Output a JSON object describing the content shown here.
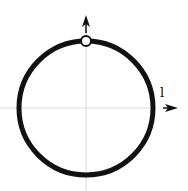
{
  "diagram": {
    "type": "circle-with-axes",
    "label_right": "l",
    "colors": {
      "circle": "#111111",
      "axes": "#d8d8d8",
      "arrow": "#111111",
      "point_fill": "#ffffff"
    },
    "elements": [
      {
        "name": "circle",
        "description": "thick black circle centered at axes origin"
      },
      {
        "name": "open-point",
        "description": "hollow point at top of circle"
      },
      {
        "name": "up-arrow",
        "description": "arrow pointing upward above the top point"
      },
      {
        "name": "right-arrow",
        "description": "arrow pointing right at end of horizontal axis"
      }
    ]
  }
}
